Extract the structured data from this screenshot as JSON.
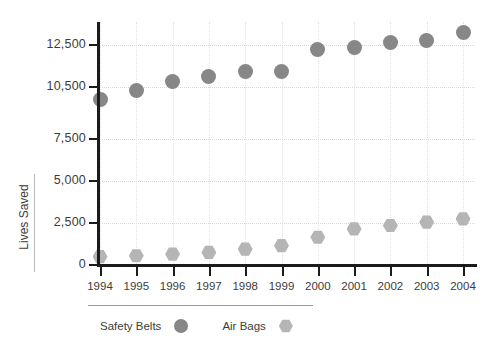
{
  "chart_data": {
    "type": "scatter",
    "title": "",
    "subtitle": "",
    "xlabel": "",
    "ylabel": "Lives Saved",
    "grid": true,
    "legend_position": "bottom",
    "categories": [
      "1994",
      "1995",
      "1996",
      "1997",
      "1998",
      "1999",
      "2000",
      "2001",
      "2002",
      "2003",
      "2004"
    ],
    "x": [
      1994,
      1995,
      1996,
      1997,
      1998,
      1999,
      2000,
      2001,
      2002,
      2003,
      2004
    ],
    "ytick_labels": [
      "0",
      "2,500",
      "5,000",
      "7,500",
      "10,500",
      "12,500"
    ],
    "ytick_values": [
      0,
      2500,
      5000,
      7500,
      10500,
      12500
    ],
    "ylim": [
      0,
      13500
    ],
    "series": [
      {
        "name": "Safety Belts",
        "marker": "circle",
        "color": "#878787",
        "values": [
          9800,
          10300,
          10750,
          11000,
          11250,
          11250,
          12300,
          12400,
          12600,
          12700,
          13100
        ]
      },
      {
        "name": "Air Bags",
        "marker": "hexagon",
        "color": "#b5b5b5",
        "values": [
          500,
          550,
          650,
          750,
          950,
          1150,
          1650,
          2150,
          2350,
          2550,
          2750
        ]
      }
    ]
  },
  "axes": {
    "y_title": "Lives Saved"
  },
  "legend": {
    "items": [
      {
        "label": "Safety Belts",
        "marker": "circle",
        "color": "#878787"
      },
      {
        "label": "Air Bags",
        "marker": "hexagon",
        "color": "#b5b5b5"
      }
    ]
  },
  "colors": {
    "axis": "#1b1b1b",
    "grid": "#d8d8d8",
    "text": "#3c3c3c",
    "background": "#ffffff",
    "safety_belts": "#878787",
    "air_bags": "#b5b5b5"
  }
}
